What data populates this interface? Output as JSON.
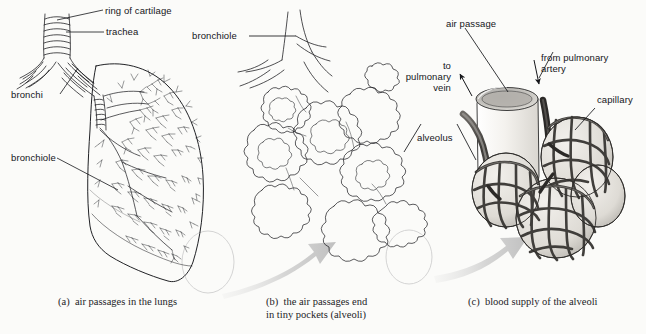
{
  "figure": {
    "background_color": "#fbfbf9",
    "ink_color": "#15161a",
    "panel_count": 3
  },
  "panels": [
    {
      "id": "a",
      "caption": "(a)  air passages in the lungs",
      "caption_lines": [
        "(a)  air passages in the lungs"
      ],
      "labels": [
        {
          "name": "ring-of-cartilage",
          "text": "ring of cartilage"
        },
        {
          "name": "trachea",
          "text": "trachea"
        },
        {
          "name": "bronchi",
          "text": "bronchi"
        },
        {
          "name": "bronchiole",
          "text": "bronchiole"
        }
      ]
    },
    {
      "id": "b",
      "caption": "(b)  the air passages end in tiny pockets (alveoli)",
      "caption_lines": [
        "(b)  the air passages end",
        "in tiny pockets (alveoli)"
      ],
      "labels": [
        {
          "name": "bronchiole",
          "text": "bronchiole"
        }
      ]
    },
    {
      "id": "c",
      "caption": "(c)  blood supply of the alveoli",
      "caption_lines": [
        "(c)  blood supply of the alveoli"
      ],
      "labels": [
        {
          "name": "air-passage",
          "text": "air passage"
        },
        {
          "name": "from-pulmonary-artery",
          "text": "from pulmonary\nartery"
        },
        {
          "name": "to-pulmonary-vein",
          "text": "to\npulmonary\nvein"
        },
        {
          "name": "capillary",
          "text": "capillary"
        },
        {
          "name": "alveolus",
          "text": "alveolus"
        }
      ]
    }
  ],
  "annotations": {
    "zoom_arrows": [
      {
        "name": "zoom-arrow-a-to-b",
        "from_panel": "a",
        "to_panel": "b"
      },
      {
        "name": "zoom-arrow-b-to-c",
        "from_panel": "b",
        "to_panel": "c"
      }
    ],
    "highlight_circles": [
      {
        "name": "highlight-circle-a",
        "panel": "a"
      },
      {
        "name": "highlight-circle-b",
        "panel": "b"
      }
    ]
  }
}
